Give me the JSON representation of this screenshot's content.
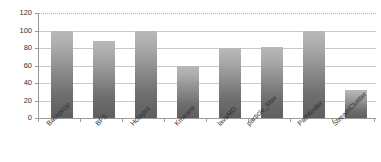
{
  "chart_data": {
    "type": "bar",
    "title": "",
    "subtitle": "",
    "xlabel": "",
    "ylabel": "",
    "categories": [
      "Backprop",
      "BFS",
      "Hotspot",
      "Kmeans",
      "lavaMD",
      "particle_filter",
      "Pathfinder",
      "StreamCluster"
    ],
    "values": [
      100,
      88,
      100,
      60,
      80,
      81,
      100,
      32
    ],
    "series": [
      {
        "name": "value",
        "values": [
          100,
          88,
          100,
          60,
          80,
          81,
          100,
          32
        ]
      }
    ],
    "ylim": [
      0,
      120
    ],
    "yticks": [
      0,
      20,
      40,
      60,
      80,
      100,
      120
    ],
    "ytick_labels": [
      "0",
      "20",
      "40",
      "60",
      "80",
      "100",
      "120"
    ],
    "grid": true,
    "grid_axis": "y",
    "legend": false,
    "legend_position": "none",
    "bar_color_top": "#b9b9b9",
    "bar_color_bottom": "#5e5e5e",
    "gridline_color": "#c9c9c9",
    "axis_color": "#9a9a9a",
    "background_color": "#ffffff",
    "label_rotation": -45,
    "annotations": []
  },
  "axes": {
    "y": {
      "ticks": [
        {
          "label": "120",
          "value": 120
        },
        {
          "label": "100",
          "value": 100
        },
        {
          "label": "80",
          "value": 80
        },
        {
          "label": "60",
          "value": 60
        },
        {
          "label": "40",
          "value": 40
        },
        {
          "label": "20",
          "value": 20
        },
        {
          "label": "0",
          "value": 0
        }
      ]
    }
  }
}
